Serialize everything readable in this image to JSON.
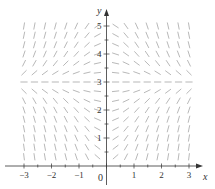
{
  "chart_data": {
    "type": "slope_field",
    "title": "",
    "equation": "dy/dx = x(3 - y)",
    "xlabel": "x",
    "ylabel": "y",
    "xlim": [
      -3.3,
      3.4
    ],
    "ylim": [
      0,
      5.6
    ],
    "x_ticks": [
      -3,
      -2,
      -1,
      0,
      1,
      2,
      3
    ],
    "x_tick_labels": [
      "−3",
      "−2",
      "−1",
      "0",
      "1",
      "2",
      "3"
    ],
    "y_ticks": [
      1,
      2,
      3,
      4,
      5
    ],
    "y_tick_labels": [
      "1",
      "2",
      "3",
      "4",
      "5"
    ],
    "grid": false,
    "equilibrium_y": 3,
    "grid_x": [
      -3.0,
      -2.62,
      -2.24,
      -1.86,
      -1.48,
      -1.1,
      -0.71,
      -0.33,
      0.33,
      0.71,
      1.1,
      1.48,
      1.86,
      2.24,
      2.62,
      3.0
    ],
    "grid_y": [
      0.33,
      0.67,
      1.0,
      1.33,
      1.67,
      2.0,
      2.33,
      2.67,
      3.0,
      3.33,
      3.67,
      4.0,
      4.33,
      4.67,
      5.0
    ],
    "colors": {
      "segments": "#9a9a9a",
      "axes": "#333333"
    }
  },
  "axes": {
    "x_name": "x",
    "y_name": "y",
    "origin_label": "0"
  }
}
